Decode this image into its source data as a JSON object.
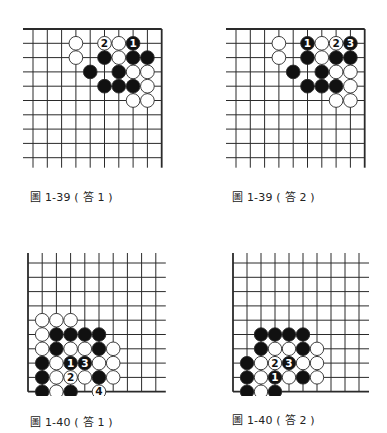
{
  "diagrams": [
    {
      "id": "d1",
      "caption": "圖 1-39 ( 答 1 )",
      "edges": "top-right",
      "origin": [
        33,
        29
      ],
      "spacing": [
        14.3,
        14.3
      ],
      "cols": 10,
      "rows": 10,
      "stones": [
        {
          "c": 3,
          "r": 1,
          "color": "white"
        },
        {
          "c": 5,
          "r": 1,
          "color": "white",
          "label": "2"
        },
        {
          "c": 6,
          "r": 1,
          "color": "white"
        },
        {
          "c": 7,
          "r": 1,
          "color": "black",
          "label": "1"
        },
        {
          "c": 3,
          "r": 2,
          "color": "white"
        },
        {
          "c": 5,
          "r": 2,
          "color": "black"
        },
        {
          "c": 6,
          "r": 2,
          "color": "white"
        },
        {
          "c": 7,
          "r": 2,
          "color": "black"
        },
        {
          "c": 8,
          "r": 2,
          "color": "black"
        },
        {
          "c": 4,
          "r": 3,
          "color": "black"
        },
        {
          "c": 6,
          "r": 3,
          "color": "black"
        },
        {
          "c": 7,
          "r": 3,
          "color": "white"
        },
        {
          "c": 8,
          "r": 3,
          "color": "white"
        },
        {
          "c": 5,
          "r": 4,
          "color": "black"
        },
        {
          "c": 6,
          "r": 4,
          "color": "black"
        },
        {
          "c": 7,
          "r": 4,
          "color": "black"
        },
        {
          "c": 8,
          "r": 4,
          "color": "white"
        },
        {
          "c": 7,
          "r": 5,
          "color": "white"
        },
        {
          "c": 8,
          "r": 5,
          "color": "white"
        }
      ]
    },
    {
      "id": "d2",
      "caption": "圖 1-39 ( 答 2 )",
      "edges": "top-right",
      "origin": [
        236,
        29
      ],
      "spacing": [
        14.3,
        14.3
      ],
      "cols": 10,
      "rows": 10,
      "stones": [
        {
          "c": 3,
          "r": 1,
          "color": "white"
        },
        {
          "c": 5,
          "r": 1,
          "color": "black",
          "label": "1"
        },
        {
          "c": 6,
          "r": 1,
          "color": "white"
        },
        {
          "c": 7,
          "r": 1,
          "color": "white",
          "label": "2"
        },
        {
          "c": 8,
          "r": 1,
          "color": "black",
          "label": "3"
        },
        {
          "c": 3,
          "r": 2,
          "color": "white"
        },
        {
          "c": 5,
          "r": 2,
          "color": "black"
        },
        {
          "c": 6,
          "r": 2,
          "color": "white"
        },
        {
          "c": 7,
          "r": 2,
          "color": "black"
        },
        {
          "c": 8,
          "r": 2,
          "color": "black"
        },
        {
          "c": 4,
          "r": 3,
          "color": "black"
        },
        {
          "c": 6,
          "r": 3,
          "color": "black"
        },
        {
          "c": 7,
          "r": 3,
          "color": "white"
        },
        {
          "c": 8,
          "r": 3,
          "color": "white"
        },
        {
          "c": 5,
          "r": 4,
          "color": "black"
        },
        {
          "c": 6,
          "r": 4,
          "color": "black"
        },
        {
          "c": 7,
          "r": 4,
          "color": "black"
        },
        {
          "c": 8,
          "r": 4,
          "color": "white"
        },
        {
          "c": 7,
          "r": 5,
          "color": "white"
        },
        {
          "c": 8,
          "r": 5,
          "color": "white"
        }
      ]
    },
    {
      "id": "d3",
      "caption": "圖 1-40 ( 答 1 )",
      "edges": "bottom-left",
      "origin": [
        28,
        263
      ],
      "spacing": [
        14.2,
        14.3
      ],
      "cols": 10,
      "rows": 10,
      "stones": [
        {
          "c": 1,
          "r": 4,
          "color": "white"
        },
        {
          "c": 2,
          "r": 4,
          "color": "white"
        },
        {
          "c": 3,
          "r": 4,
          "color": "white"
        },
        {
          "c": 1,
          "r": 5,
          "color": "white"
        },
        {
          "c": 2,
          "r": 5,
          "color": "black"
        },
        {
          "c": 3,
          "r": 5,
          "color": "black"
        },
        {
          "c": 4,
          "r": 5,
          "color": "black"
        },
        {
          "c": 5,
          "r": 5,
          "color": "black"
        },
        {
          "c": 1,
          "r": 6,
          "color": "white"
        },
        {
          "c": 2,
          "r": 6,
          "color": "black"
        },
        {
          "c": 3,
          "r": 6,
          "color": "white"
        },
        {
          "c": 4,
          "r": 6,
          "color": "white"
        },
        {
          "c": 5,
          "r": 6,
          "color": "black"
        },
        {
          "c": 6,
          "r": 6,
          "color": "white"
        },
        {
          "c": 1,
          "r": 7,
          "color": "black"
        },
        {
          "c": 2,
          "r": 7,
          "color": "white"
        },
        {
          "c": 3,
          "r": 7,
          "color": "black",
          "label": "1"
        },
        {
          "c": 4,
          "r": 7,
          "color": "black",
          "label": "3"
        },
        {
          "c": 5,
          "r": 7,
          "color": "white"
        },
        {
          "c": 6,
          "r": 7,
          "color": "white"
        },
        {
          "c": 1,
          "r": 8,
          "color": "black"
        },
        {
          "c": 2,
          "r": 8,
          "color": "white"
        },
        {
          "c": 3,
          "r": 8,
          "color": "white",
          "label": "2"
        },
        {
          "c": 4,
          "r": 8,
          "color": "white"
        },
        {
          "c": 5,
          "r": 8,
          "color": "black"
        },
        {
          "c": 6,
          "r": 8,
          "color": "white"
        },
        {
          "c": 1,
          "r": 9,
          "color": "black"
        },
        {
          "c": 2,
          "r": 9,
          "color": "white"
        },
        {
          "c": 3,
          "r": 9,
          "color": "black"
        },
        {
          "c": 5,
          "r": 9,
          "color": "white",
          "label": "4"
        }
      ]
    },
    {
      "id": "d4",
      "caption": "圖 1-40 ( 答 2 )",
      "edges": "bottom-left",
      "origin": [
        233,
        263
      ],
      "spacing": [
        14.0,
        14.3
      ],
      "cols": 10,
      "rows": 10,
      "stones": [
        {
          "c": 2,
          "r": 5,
          "color": "black"
        },
        {
          "c": 3,
          "r": 5,
          "color": "black"
        },
        {
          "c": 4,
          "r": 5,
          "color": "black"
        },
        {
          "c": 5,
          "r": 5,
          "color": "black"
        },
        {
          "c": 2,
          "r": 6,
          "color": "black"
        },
        {
          "c": 3,
          "r": 6,
          "color": "white"
        },
        {
          "c": 4,
          "r": 6,
          "color": "white"
        },
        {
          "c": 5,
          "r": 6,
          "color": "black"
        },
        {
          "c": 6,
          "r": 6,
          "color": "white"
        },
        {
          "c": 1,
          "r": 7,
          "color": "black"
        },
        {
          "c": 2,
          "r": 7,
          "color": "white"
        },
        {
          "c": 3,
          "r": 7,
          "color": "white",
          "label": "2"
        },
        {
          "c": 4,
          "r": 7,
          "color": "black",
          "label": "3"
        },
        {
          "c": 5,
          "r": 7,
          "color": "white"
        },
        {
          "c": 6,
          "r": 7,
          "color": "white"
        },
        {
          "c": 1,
          "r": 8,
          "color": "black"
        },
        {
          "c": 2,
          "r": 8,
          "color": "white"
        },
        {
          "c": 3,
          "r": 8,
          "color": "black",
          "label": "1"
        },
        {
          "c": 4,
          "r": 8,
          "color": "white"
        },
        {
          "c": 5,
          "r": 8,
          "color": "black"
        },
        {
          "c": 6,
          "r": 8,
          "color": "white"
        },
        {
          "c": 1,
          "r": 9,
          "color": "black"
        },
        {
          "c": 2,
          "r": 9,
          "color": "white"
        },
        {
          "c": 3,
          "r": 9,
          "color": "black"
        }
      ]
    }
  ],
  "captions": {
    "d1": "圖 1-39 ( 答 1 )",
    "d2": "圖 1-39 ( 答 2 )",
    "d3": "圖 1-40 ( 答 1 )",
    "d4": "圖 1-40 ( 答 2 )"
  },
  "colors": {
    "line": "#2a2a2a",
    "black_stone": "#111111",
    "white_stone": "#ffffff",
    "text": "#222222"
  }
}
